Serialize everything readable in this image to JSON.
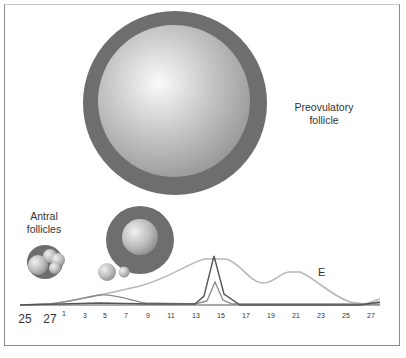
{
  "labels": {
    "preovulatory_line1": "Preovulatory",
    "preovulatory_line2": "follicle",
    "antral_line1": "Antral",
    "antral_line2": "follicles",
    "hormone_curve": "E"
  },
  "x_axis": {
    "prev_cycle_ticks": [
      "25",
      "27"
    ],
    "cycle_ticks": [
      "1",
      "3",
      "5",
      "7",
      "9",
      "11",
      "13",
      "15",
      "17",
      "19",
      "21",
      "23",
      "25",
      "27"
    ]
  },
  "colors": {
    "theca_ring": "#6e6e6e",
    "antrum_light": "#f4f4f4",
    "antrum_dark": "#9a9a9a",
    "estrogen_curve": "#b8b8b8",
    "lh_curve": "#555555",
    "fsh_curve": "#8a8a8a"
  }
}
